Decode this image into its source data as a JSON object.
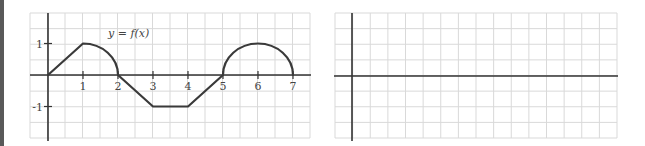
{
  "chart_data": [
    {
      "type": "line",
      "title": "",
      "annotation": "y = f(x)",
      "xlabel": "",
      "ylabel": "",
      "xlim": [
        -0.5,
        7.5
      ],
      "ylim": [
        -2,
        2
      ],
      "x_ticks": [
        "1",
        "2",
        "3",
        "4",
        "5",
        "6",
        "7"
      ],
      "y_ticks": [
        "1",
        "-1"
      ],
      "grid": true,
      "grid_step_x": 0.5,
      "grid_step_y": 0.5,
      "segments": [
        {
          "kind": "line",
          "from": [
            0,
            0
          ],
          "to": [
            1,
            1
          ]
        },
        {
          "kind": "quarter-circle",
          "center": [
            1,
            0
          ],
          "radius": 1,
          "from": [
            1,
            1
          ],
          "to": [
            2,
            0
          ]
        },
        {
          "kind": "line",
          "from": [
            2,
            0
          ],
          "to": [
            3,
            -1
          ]
        },
        {
          "kind": "line",
          "from": [
            3,
            -1
          ],
          "to": [
            4,
            -1
          ]
        },
        {
          "kind": "line",
          "from": [
            4,
            -1
          ],
          "to": [
            5,
            0
          ]
        },
        {
          "kind": "semicircle",
          "center": [
            6,
            0
          ],
          "radius": 1,
          "from": [
            5,
            0
          ],
          "to": [
            7,
            0
          ]
        }
      ],
      "x": [
        0,
        1,
        2,
        3,
        4,
        5,
        6,
        7
      ],
      "values": [
        0,
        1,
        0,
        -1,
        -1,
        0,
        1,
        0
      ]
    },
    {
      "type": "line",
      "title": "",
      "xlabel": "",
      "ylabel": "",
      "grid": true,
      "x_ticks": [],
      "y_ticks": [],
      "series": []
    }
  ],
  "colors": {
    "curve": "#3a3a3a",
    "axis": "#333333",
    "grid": "#d9d9d9",
    "edge_strip": "#595959"
  }
}
